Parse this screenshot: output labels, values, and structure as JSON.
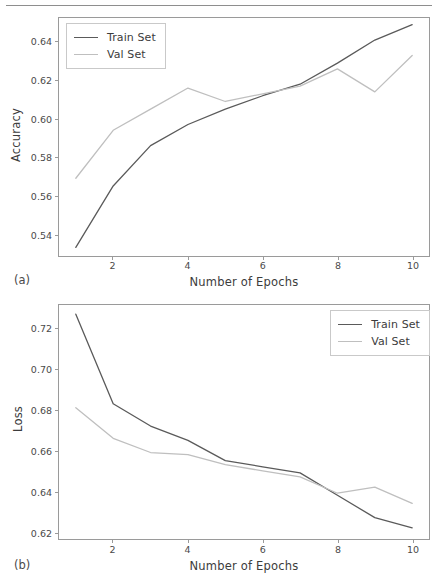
{
  "figure": {
    "top_rule_visible": true,
    "colors": {
      "train": "#5a5a5a",
      "val": "#bfbfbf",
      "axis": "#9a9a9a",
      "text": "#3c3c3c",
      "background": "#ffffff"
    }
  },
  "panels": [
    {
      "caption": "(a)",
      "legend_position": "upper left",
      "chart_data": {
        "type": "line",
        "title": "",
        "xlabel": "Number of Epochs",
        "ylabel": "Accuracy",
        "x": [
          1,
          2,
          3,
          4,
          5,
          6,
          7,
          8,
          9,
          10
        ],
        "xticks": [
          2,
          4,
          6,
          8,
          10
        ],
        "xticklabels": [
          "2",
          "4",
          "6",
          "8",
          "10"
        ],
        "yticks": [
          0.54,
          0.56,
          0.58,
          0.6,
          0.62,
          0.64
        ],
        "yticklabels": [
          "0.54",
          "0.56",
          "0.58",
          "0.60",
          "0.62",
          "0.64"
        ],
        "xlim": [
          0.55,
          10.45
        ],
        "ylim": [
          0.5285,
          0.6525
        ],
        "grid": false,
        "legend": [
          "Train Set",
          "Val Set"
        ],
        "series": [
          {
            "name": "Train Set",
            "color": "#5a5a5a",
            "values": [
              0.533,
              0.565,
              0.586,
              0.597,
              0.605,
              0.612,
              0.618,
              0.629,
              0.641,
              0.649
            ]
          },
          {
            "name": "Val Set",
            "color": "#bfbfbf",
            "values": [
              0.569,
              0.594,
              0.605,
              0.616,
              0.609,
              0.613,
              0.617,
              0.626,
              0.614,
              0.633
            ]
          }
        ]
      }
    },
    {
      "caption": "(b)",
      "legend_position": "upper right",
      "chart_data": {
        "type": "line",
        "title": "",
        "xlabel": "Number of Epochs",
        "ylabel": "Loss",
        "x": [
          1,
          2,
          3,
          4,
          5,
          6,
          7,
          8,
          9,
          10
        ],
        "xticks": [
          2,
          4,
          6,
          8,
          10
        ],
        "xticklabels": [
          "2",
          "4",
          "6",
          "8",
          "10"
        ],
        "yticks": [
          0.62,
          0.64,
          0.66,
          0.68,
          0.7,
          0.72
        ],
        "yticklabels": [
          "0.62",
          "0.64",
          "0.66",
          "0.68",
          "0.70",
          "0.72"
        ],
        "xlim": [
          0.55,
          10.45
        ],
        "ylim": [
          0.6165,
          0.7315
        ],
        "grid": false,
        "legend": [
          "Train Set",
          "Val Set"
        ],
        "series": [
          {
            "name": "Train Set",
            "color": "#5a5a5a",
            "values": [
              0.727,
              0.683,
              0.672,
              0.665,
              0.655,
              0.652,
              0.649,
              0.638,
              0.627,
              0.622
            ]
          },
          {
            "name": "Val Set",
            "color": "#bfbfbf",
            "values": [
              0.681,
              0.666,
              0.659,
              0.658,
              0.653,
              0.65,
              0.647,
              0.639,
              0.642,
              0.634
            ]
          }
        ]
      }
    }
  ]
}
